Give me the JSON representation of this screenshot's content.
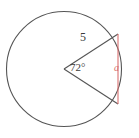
{
  "figure": {
    "type": "geometry-diagram",
    "background_color": "#ffffff",
    "stroke_color": "#555555",
    "chord_color": "#d96f6f",
    "text_color": "#3b3b3b",
    "circle": {
      "center_x": 64,
      "center_y": 69,
      "radius": 59
    },
    "central_angle_degrees": 72,
    "labels": {
      "radius": "5",
      "angle": "72°",
      "chord": "a"
    },
    "vertices": {
      "center": [
        64,
        69
      ],
      "upper_point": [
        118,
        34
      ],
      "lower_point": [
        118,
        104
      ]
    }
  }
}
